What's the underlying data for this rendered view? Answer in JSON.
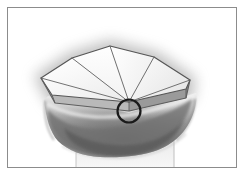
{
  "figure": {
    "title": "Anatomical occlusal surface diagram",
    "caption": "Faceted polygonal occlusal plane overlying a tooth crown with circular highlight marker",
    "rendering": "grayscale line-and-wash illustration",
    "frame": {
      "border_color": "#8c8c8c",
      "border_width_px": 1,
      "background_color": "#ffffff",
      "inset_px": 7
    },
    "palette": {
      "background": "#ffffff",
      "frame_border": "#8c8c8c",
      "outline_stroke": "#4a4a4a",
      "facet_fill_light": "#fdfdfd",
      "facet_fill_mid": "#f1f1f1",
      "facet_fill_shade": "#e2e2e2",
      "slab_edge_dark": "#8f8f8f",
      "slab_edge_mid": "#b4b4b4",
      "tooth_light": "#e8e8e8",
      "tooth_mid": "#a8a8a8",
      "tooth_dark": "#6f6f6f",
      "tooth_darkest": "#565656",
      "root_light": "#f0f0f0",
      "halo_shadow": "#9a9a9a",
      "marker_stroke": "#1a1a1a"
    },
    "marker": {
      "name": "circular-highlight",
      "shape": "circle",
      "center_x": 129,
      "center_y": 111,
      "radius": 11.5,
      "stroke_color": "#1a1a1a",
      "stroke_width": 2.2,
      "fill": "none",
      "purpose": "highlights convergence vertex of facet ridge lines"
    },
    "plane": {
      "name": "faceted-occlusal-plane",
      "vertices": [
        {
          "id": "apex",
          "x": 110,
          "y": 46
        },
        {
          "id": "upper-right",
          "x": 154,
          "y": 57
        },
        {
          "id": "right",
          "x": 190,
          "y": 80
        },
        {
          "id": "lower-right",
          "x": 186,
          "y": 98
        },
        {
          "id": "convergence",
          "x": 129,
          "y": 111
        },
        {
          "id": "lower-left",
          "x": 55,
          "y": 103
        },
        {
          "id": "left",
          "x": 41,
          "y": 78
        },
        {
          "id": "upper-left",
          "x": 72,
          "y": 58
        }
      ],
      "facet_count": 6,
      "ridge_lines": [
        {
          "from": "apex",
          "to": "convergence"
        },
        {
          "from": "convergence",
          "to": "upper-left"
        },
        {
          "from": "convergence",
          "to": "left"
        },
        {
          "from": "convergence",
          "to": "right"
        },
        {
          "from": "upper-right",
          "to": "convergence"
        }
      ],
      "slab_thickness_px": 9,
      "slab_side_visible": true
    },
    "tooth": {
      "name": "tooth-crown-silhouette",
      "crown_top_y": 104,
      "crown_bottom_y": 152,
      "crown_left_x": 43,
      "crown_right_x": 198,
      "root_stem_visible": true,
      "root_stem_left_x": 75,
      "root_stem_right_x": 175,
      "shading": "soft airbrush gradient, darker toward lower center"
    },
    "halo": {
      "name": "soft-drop-shadow-halo",
      "visible": true,
      "color": "#9a9a9a",
      "blur_px": 14
    }
  }
}
